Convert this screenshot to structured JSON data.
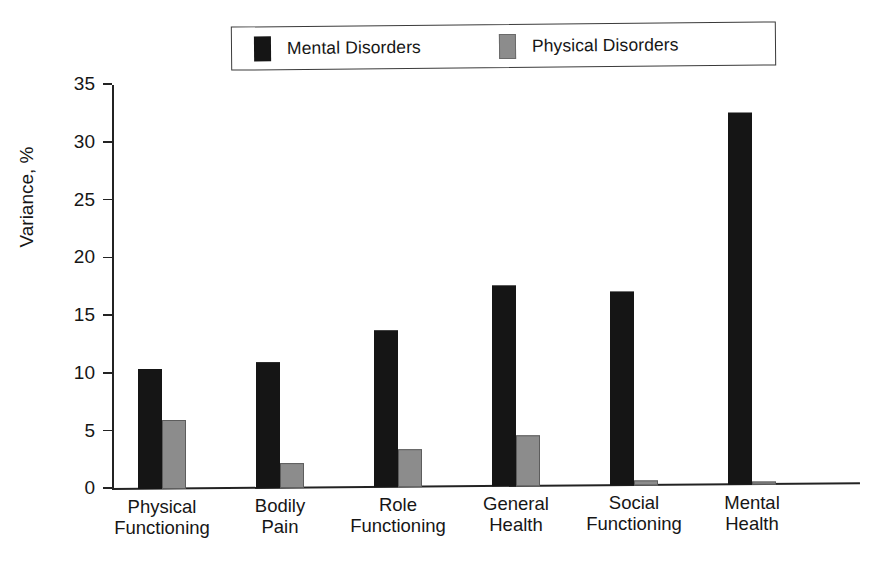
{
  "chart_data": {
    "type": "bar",
    "title": "",
    "xlabel": "",
    "ylabel": "Variance, %",
    "ylim": [
      0,
      35
    ],
    "yticks": [
      0,
      5,
      10,
      15,
      20,
      25,
      30,
      35
    ],
    "ytick_labels": [
      "0",
      "5",
      "10",
      "15",
      "20",
      "25",
      "30",
      "35"
    ],
    "grid": false,
    "legend_position": "top",
    "categories": [
      "Physical Functioning",
      "Bodily Pain",
      "Role Functioning",
      "General Health",
      "Social Functioning",
      "Mental Health"
    ],
    "category_lines": [
      [
        "Physical",
        "Functioning"
      ],
      [
        "Bodily",
        "Pain"
      ],
      [
        "Role",
        "Functioning"
      ],
      [
        "General",
        "Health"
      ],
      [
        "Social",
        "Functioning"
      ],
      [
        "Mental",
        "Health"
      ]
    ],
    "series": [
      {
        "name": "Mental Disorders",
        "color": "#151515",
        "values": [
          10.4,
          10.9,
          13.6,
          17.4,
          16.8,
          32.2
        ]
      },
      {
        "name": "Physical Disorders",
        "color": "#8c8c8c",
        "values": [
          6.0,
          2.2,
          3.3,
          4.4,
          0.4,
          0.3
        ]
      }
    ]
  },
  "legend": {
    "entries": [
      {
        "label": "Mental Disorders",
        "swatch": "#151515",
        "icon": "legend-swatch-black"
      },
      {
        "label": "Physical Disorders",
        "swatch": "#8c8c8c",
        "icon": "legend-swatch-gray"
      }
    ]
  }
}
